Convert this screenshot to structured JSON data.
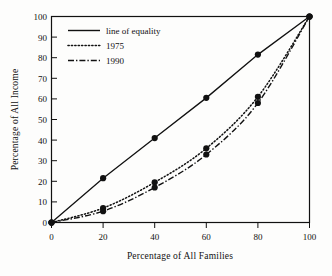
{
  "chart_data": {
    "type": "line",
    "title": "",
    "subtitle": "",
    "xlabel": "Percentage of All Families",
    "ylabel": "Percentage of All Income",
    "xlim": [
      0,
      100
    ],
    "ylim": [
      0,
      100
    ],
    "xticks": [
      0,
      20,
      40,
      60,
      80,
      100
    ],
    "yticks": [
      0,
      10,
      20,
      30,
      40,
      50,
      60,
      70,
      80,
      90,
      100
    ],
    "xtick_labels": [
      "0",
      "20",
      "40",
      "60",
      "80",
      "100"
    ],
    "ytick_labels": [
      "0",
      "10",
      "20",
      "30",
      "40",
      "50",
      "60",
      "70",
      "80",
      "90",
      "100"
    ],
    "grid": false,
    "legend_position": "upper-left",
    "x": [
      0,
      20,
      40,
      60,
      80,
      100
    ],
    "series": [
      {
        "name": "line of equality",
        "style": "solid",
        "markers": true,
        "values": [
          0,
          21.5,
          41,
          60.5,
          81.5,
          100
        ]
      },
      {
        "name": "1975",
        "style": "dotted",
        "markers": true,
        "values": [
          0,
          7,
          19.5,
          36,
          61,
          100
        ]
      },
      {
        "name": "1990",
        "style": "dash-dot",
        "markers": true,
        "values": [
          0,
          5.5,
          17,
          33,
          58,
          100
        ]
      }
    ],
    "annotations": []
  },
  "legend": {
    "entries": [
      {
        "label": "line of equality",
        "style": "solid"
      },
      {
        "label": "1975",
        "style": "dotted"
      },
      {
        "label": "1990",
        "style": "dash-dot"
      }
    ]
  },
  "axes": {
    "x_title": "Percentage of All Families",
    "y_title": "Percentage of All Income"
  }
}
